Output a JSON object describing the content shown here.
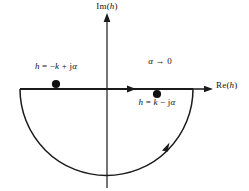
{
  "figure": {
    "type": "complex-plane-contour-diagram",
    "background_color": "#ffffff",
    "stroke_color": "#1a1a1a",
    "text_color": "#111111"
  },
  "axes": {
    "imaginary": {
      "label": "Im(h)",
      "label_math": {
        "func": "Im",
        "open": "(",
        "var": "h",
        "close": ")"
      },
      "orientation": "vertical",
      "arrow_direction": "up"
    },
    "real": {
      "label": "Re(h)",
      "label_math": {
        "func": "Re",
        "open": "(",
        "var": "h",
        "close": ")"
      },
      "orientation": "horizontal",
      "arrow_direction": "right"
    },
    "origin": {
      "x": 107,
      "y": 89
    }
  },
  "contour": {
    "name": "closed semicircular contour",
    "half_plane": "lower",
    "center": {
      "x": 107,
      "y": 89
    },
    "radius": 86,
    "direction": "counterclockwise",
    "segments": [
      {
        "name": "real-axis-chord",
        "from_x": 20,
        "to_x": 193,
        "y": 89,
        "arrow_at_x": 133,
        "arrow_direction": "right"
      },
      {
        "name": "lower-arc",
        "arrow_at": {
          "x": 166,
          "y": 147
        },
        "arrow_direction": "up-right"
      }
    ]
  },
  "poles": [
    {
      "name": "pole-left",
      "label": "h = -k + jα",
      "label_parts": {
        "var": "h",
        "eq": " = ",
        "sign": "−",
        "k": "k",
        "op": " + ",
        "j": "j",
        "alpha": "α"
      },
      "x": 56,
      "y": 84,
      "position": "above-real-axis",
      "marker": "filled-circle"
    },
    {
      "name": "pole-right",
      "label": "h = k - jα",
      "label_parts": {
        "var": "h",
        "eq": " = ",
        "sign": "",
        "k": "k",
        "op": " − ",
        "j": "j",
        "alpha": "α"
      },
      "x": 157,
      "y": 94,
      "position": "below-real-axis",
      "marker": "filled-circle"
    }
  ],
  "annotations": [
    {
      "name": "alpha-limit",
      "text": "α → 0",
      "alpha": "α",
      "arrow": "→",
      "value": "0",
      "x": 160,
      "y": 63
    }
  ]
}
